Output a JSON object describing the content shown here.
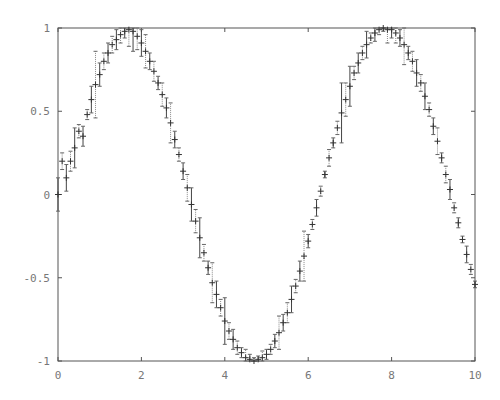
{
  "chart_data": {
    "type": "scatter",
    "title": "",
    "xlabel": "",
    "ylabel": "",
    "xlim": [
      0,
      10
    ],
    "ylim": [
      -1,
      1
    ],
    "grid": false,
    "legend": null,
    "x_ticks": [
      "0",
      "2",
      "4",
      "6",
      "8",
      "10"
    ],
    "y_ticks": [
      "1",
      "0.5",
      "0",
      "-0.5",
      "-1"
    ],
    "series": [
      {
        "name": "sin(x) with errors",
        "marker": "+",
        "x": [
          0.0,
          0.1,
          0.2,
          0.3,
          0.4,
          0.5,
          0.6,
          0.7,
          0.8,
          0.9,
          1.0,
          1.1,
          1.2,
          1.3,
          1.4,
          1.5,
          1.6,
          1.7,
          1.8,
          1.9,
          2.0,
          2.1,
          2.2,
          2.3,
          2.4,
          2.5,
          2.6,
          2.7,
          2.8,
          2.9,
          3.0,
          3.1,
          3.2,
          3.3,
          3.4,
          3.5,
          3.6,
          3.7,
          3.8,
          3.9,
          4.0,
          4.1,
          4.2,
          4.3,
          4.4,
          4.5,
          4.6,
          4.7,
          4.8,
          4.9,
          5.0,
          5.1,
          5.2,
          5.3,
          5.4,
          5.5,
          5.6,
          5.7,
          5.8,
          5.9,
          6.0,
          6.1,
          6.2,
          6.3,
          6.4,
          6.5,
          6.6,
          6.7,
          6.8,
          6.9,
          7.0,
          7.1,
          7.2,
          7.3,
          7.4,
          7.5,
          7.6,
          7.7,
          7.8,
          7.9,
          8.0,
          8.1,
          8.2,
          8.3,
          8.4,
          8.5,
          8.6,
          8.7,
          8.8,
          8.9,
          9.0,
          9.1,
          9.2,
          9.3,
          9.4,
          9.5,
          9.6,
          9.7,
          9.8,
          9.9,
          10.0
        ],
        "y": [
          0.0,
          0.2,
          0.1,
          0.2,
          0.28,
          0.38,
          0.35,
          0.48,
          0.57,
          0.66,
          0.72,
          0.8,
          0.85,
          0.9,
          0.93,
          0.96,
          0.98,
          0.99,
          0.98,
          0.95,
          0.91,
          0.86,
          0.8,
          0.74,
          0.67,
          0.6,
          0.52,
          0.43,
          0.33,
          0.24,
          0.14,
          0.04,
          -0.06,
          -0.16,
          -0.26,
          -0.35,
          -0.44,
          -0.53,
          -0.6,
          -0.68,
          -0.76,
          -0.82,
          -0.87,
          -0.92,
          -0.95,
          -0.98,
          -0.99,
          -1.0,
          -0.99,
          -0.98,
          -0.96,
          -0.93,
          -0.88,
          -0.83,
          -0.77,
          -0.71,
          -0.63,
          -0.55,
          -0.46,
          -0.37,
          -0.28,
          -0.18,
          -0.08,
          0.02,
          0.12,
          0.22,
          0.31,
          0.4,
          0.49,
          0.57,
          0.65,
          0.73,
          0.79,
          0.85,
          0.9,
          0.94,
          0.97,
          0.99,
          1.0,
          0.99,
          0.99,
          0.97,
          0.94,
          0.9,
          0.85,
          0.8,
          0.73,
          0.67,
          0.59,
          0.51,
          0.41,
          0.32,
          0.22,
          0.12,
          0.03,
          -0.08,
          -0.17,
          -0.27,
          -0.36,
          -0.45,
          -0.54
        ],
        "err": [
          0.1,
          0.05,
          0.08,
          0.06,
          0.12,
          0.04,
          0.06,
          0.03,
          0.08,
          0.2,
          0.07,
          0.05,
          0.06,
          0.05,
          0.06,
          0.05,
          0.04,
          0.1,
          0.12,
          0.08,
          0.08,
          0.1,
          0.05,
          0.06,
          0.04,
          0.07,
          0.06,
          0.12,
          0.05,
          0.04,
          0.05,
          0.08,
          0.1,
          0.07,
          0.12,
          0.05,
          0.04,
          0.12,
          0.08,
          0.05,
          0.14,
          0.05,
          0.06,
          0.04,
          0.03,
          0.05,
          0.03,
          0.02,
          0.02,
          0.04,
          0.03,
          0.03,
          0.04,
          0.1,
          0.05,
          0.06,
          0.08,
          0.04,
          0.06,
          0.15,
          0.04,
          0.03,
          0.05,
          0.03,
          0.02,
          0.05,
          0.03,
          0.04,
          0.18,
          0.1,
          0.12,
          0.04,
          0.06,
          0.04,
          0.08,
          0.03,
          0.05,
          0.03,
          0.02,
          0.08,
          0.05,
          0.06,
          0.05,
          0.12,
          0.04,
          0.06,
          0.08,
          0.05,
          0.08,
          0.04,
          0.05,
          0.08,
          0.03,
          0.05,
          0.06,
          0.03,
          0.03,
          0.02,
          0.05,
          0.03,
          0.02
        ]
      }
    ]
  }
}
